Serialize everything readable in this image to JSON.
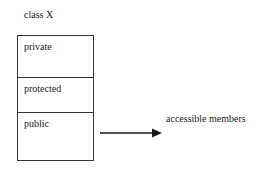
{
  "diagram": {
    "title": "class X",
    "sections": [
      {
        "label": "private"
      },
      {
        "label": "protected"
      },
      {
        "label": "public"
      }
    ],
    "arrow": {
      "from": "public",
      "label": "accessible members"
    },
    "colors": {
      "line": "#1a1a1a",
      "background": "#ffffff"
    }
  }
}
